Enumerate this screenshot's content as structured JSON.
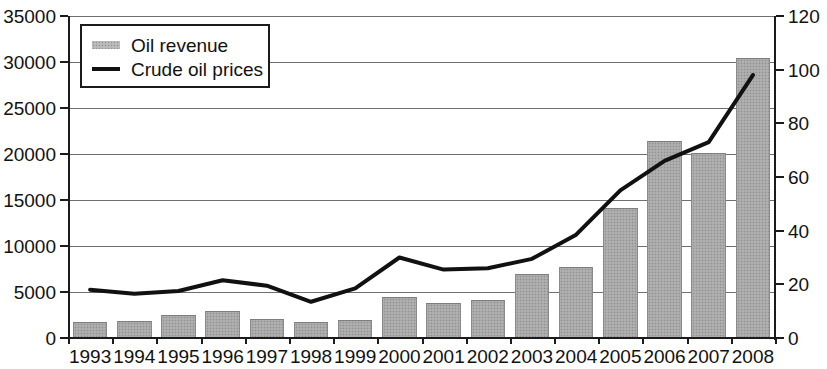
{
  "chart_data": {
    "type": "bar",
    "title": "",
    "subtitle": "",
    "xlabel": "",
    "ylabel": "",
    "grid": true,
    "legend_position": "top-left",
    "categories": [
      "1993",
      "1994",
      "1995",
      "1996",
      "1997",
      "1998",
      "1999",
      "2000",
      "2001",
      "2002",
      "2003",
      "2004",
      "2005",
      "2006",
      "2007",
      "2008"
    ],
    "axes": {
      "left": {
        "label": "",
        "min": 0,
        "max": 35000,
        "step": 5000,
        "ticks": [
          "0",
          "5000",
          "10000",
          "15000",
          "20000",
          "25000",
          "30000",
          "35000"
        ]
      },
      "right": {
        "label": "",
        "min": 0,
        "max": 120,
        "step": 20,
        "ticks": [
          "0",
          "20",
          "40",
          "60",
          "80",
          "100",
          "120"
        ]
      }
    },
    "series": [
      {
        "name": "Oil revenue",
        "type": "bar",
        "axis": "left",
        "color": "#a8a8a8",
        "values": [
          1700,
          1900,
          2500,
          2950,
          2100,
          1700,
          1950,
          4500,
          3800,
          4100,
          7000,
          7700,
          14100,
          21400,
          20100,
          30400
        ]
      },
      {
        "name": "Crude oil prices",
        "type": "line",
        "axis": "right",
        "color": "#111111",
        "values": [
          18.0,
          16.5,
          17.5,
          21.5,
          19.5,
          13.5,
          18.5,
          30.0,
          25.5,
          26.0,
          29.5,
          38.5,
          55.0,
          66.0,
          73.0,
          98.0
        ]
      }
    ]
  },
  "legend": {
    "entries": [
      {
        "label": "Oil revenue",
        "marker": "bar-swatch"
      },
      {
        "label": "Crude oil prices",
        "marker": "line-swatch"
      }
    ]
  }
}
